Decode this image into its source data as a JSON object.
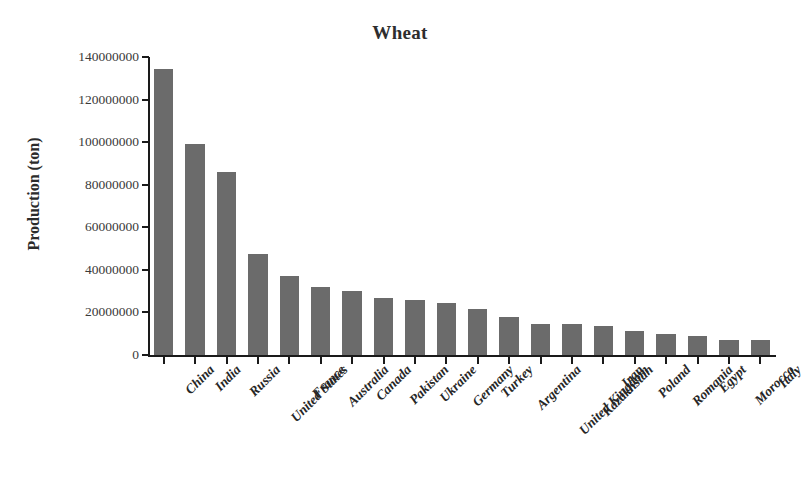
{
  "chart_data": {
    "type": "bar",
    "title": "Wheat",
    "xlabel": "",
    "ylabel": "Production (ton)",
    "ylim": [
      0,
      140000000
    ],
    "grid": false,
    "legend": false,
    "bar_color": "#6b6b6b",
    "axis_color": "#1a1a1a",
    "ytick_labels": [
      "140000000",
      "120000000",
      "100000000",
      "80000000",
      "60000000",
      "40000000",
      "20000000",
      "0"
    ],
    "ytick_values": [
      140000000,
      120000000,
      100000000,
      80000000,
      60000000,
      40000000,
      20000000,
      0
    ],
    "categories": [
      "China",
      "India",
      "Russia",
      "United States",
      "France",
      "Australia",
      "Canada",
      "Pakistan",
      "Ukraine",
      "Germany",
      "Turkey",
      "Argentina",
      "United Kingdom",
      "Kazakhstan",
      "Iran",
      "Poland",
      "Romania",
      "Egypt",
      "Morocco",
      "Italy"
    ],
    "values": [
      134500000,
      99000000,
      86000000,
      47500000,
      37000000,
      32000000,
      30000000,
      26800000,
      26000000,
      24500000,
      21500000,
      18000000,
      14800000,
      14500000,
      13800000,
      11500000,
      9800000,
      8800000,
      7000000,
      6900000
    ]
  }
}
